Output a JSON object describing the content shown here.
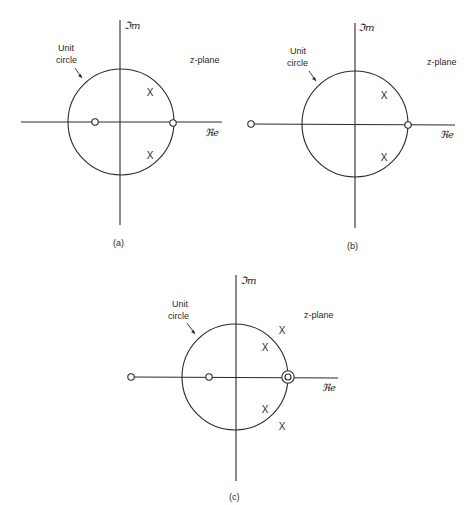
{
  "figure": {
    "panels": [
      {
        "id": "a",
        "caption": "(a)",
        "plane_label": "z-plane",
        "unit_circle_label_line1": "Unit",
        "unit_circle_label_line2": "circle",
        "imag_axis_label": "ℑm",
        "real_axis_label": "ℜe",
        "poles": [
          "upper-right inside circle",
          "lower-right inside circle"
        ],
        "zeros": [
          "negative real axis inside circle",
          "z = 1 on unit circle"
        ]
      },
      {
        "id": "b",
        "caption": "(b)",
        "plane_label": "z-plane",
        "unit_circle_label_line1": "Unit",
        "unit_circle_label_line2": "circle",
        "imag_axis_label": "ℑm",
        "real_axis_label": "ℜe",
        "poles": [
          "upper-right inside circle",
          "lower-right inside circle"
        ],
        "zeros": [
          "negative real axis outside circle",
          "z = 1 on unit circle"
        ]
      },
      {
        "id": "c",
        "caption": "(c)",
        "plane_label": "z-plane",
        "unit_circle_label_line1": "Unit",
        "unit_circle_label_line2": "circle",
        "imag_axis_label": "ℑm",
        "real_axis_label": "ℜe",
        "poles": [
          "upper-right outside circle",
          "upper-right inside circle",
          "lower-right inside circle",
          "lower-right outside circle"
        ],
        "zeros": [
          "negative real axis outside circle",
          "negative real axis inside circle",
          "double zero at z = 1 on unit circle"
        ]
      }
    ],
    "pole_marker": "X",
    "zero_marker": "O"
  }
}
